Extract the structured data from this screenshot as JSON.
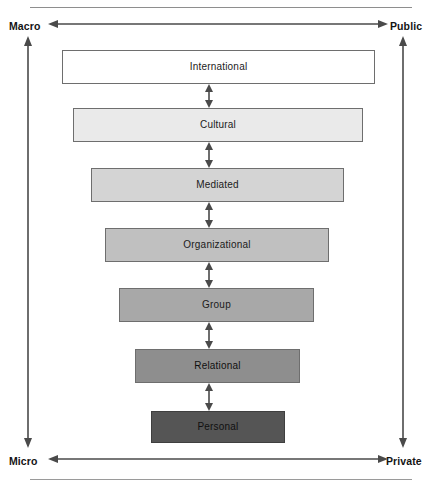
{
  "figure": {
    "axes": {
      "top_left_label": "Macro",
      "top_right_label": "Public",
      "bottom_left_label": "Micro",
      "bottom_right_label": "Private"
    },
    "levels": [
      {
        "label": "International",
        "fill": "#ffffff",
        "stroke": "#6e6e6e",
        "left": 62,
        "right": 375,
        "top": 50,
        "bottom": 84
      },
      {
        "label": "Cultural",
        "fill": "#eaeaea",
        "stroke": "#6e6e6e",
        "left": 73,
        "right": 363,
        "top": 108,
        "bottom": 142
      },
      {
        "label": "Mediated",
        "fill": "#d4d4d4",
        "stroke": "#6e6e6e",
        "left": 91,
        "right": 344,
        "top": 168,
        "bottom": 202
      },
      {
        "label": "Organizational",
        "fill": "#c0c0c0",
        "stroke": "#6e6e6e",
        "left": 105,
        "right": 329,
        "top": 228,
        "bottom": 262
      },
      {
        "label": "Group",
        "fill": "#a8a8a8",
        "stroke": "#6e6e6e",
        "left": 119,
        "right": 314,
        "top": 288,
        "bottom": 322
      },
      {
        "label": "Relational",
        "fill": "#8e8e8e",
        "stroke": "#6e6e6e",
        "left": 135,
        "right": 300,
        "top": 349,
        "bottom": 383
      },
      {
        "label": "Personal",
        "fill": "#555555",
        "stroke": "#3f3f3f",
        "left": 151,
        "right": 285,
        "top": 411,
        "bottom": 443
      }
    ],
    "connector_count": 6,
    "colors": {
      "arrow": "#4a4a4a",
      "rule": "#9a9a9a",
      "text": "#141414"
    }
  }
}
